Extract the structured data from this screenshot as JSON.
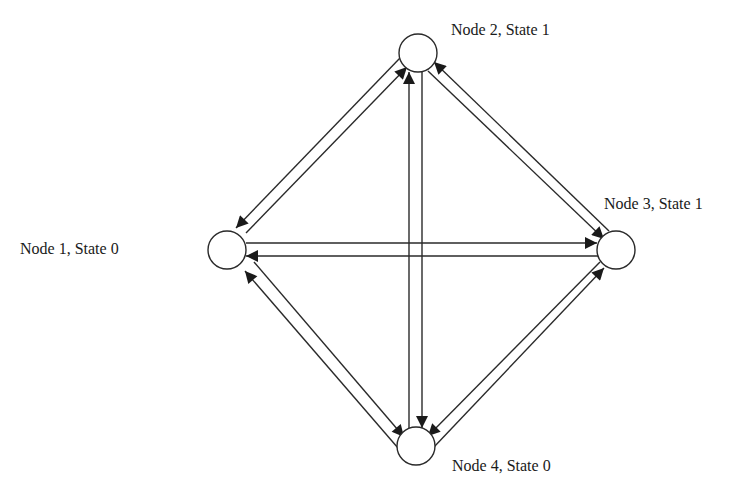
{
  "diagram": {
    "type": "state-transition-graph",
    "nodes": [
      {
        "id": "n1",
        "label": "Node 1, State 0",
        "cx": 227,
        "cy": 250,
        "r": 19,
        "label_x": 20,
        "label_y": 241
      },
      {
        "id": "n2",
        "label": "Node 2, State 1",
        "cx": 418,
        "cy": 53,
        "r": 19,
        "label_x": 451,
        "label_y": 22
      },
      {
        "id": "n3",
        "label": "Node 3, State 1",
        "cx": 616,
        "cy": 250,
        "r": 19,
        "label_x": 604,
        "label_y": 196
      },
      {
        "id": "n4",
        "label": "Node 4, State 0",
        "cx": 416,
        "cy": 446,
        "r": 19,
        "label_x": 452,
        "label_y": 458
      }
    ],
    "edges": [
      {
        "from": "n2",
        "to": "n1"
      },
      {
        "from": "n1",
        "to": "n2"
      },
      {
        "from": "n1",
        "to": "n3"
      },
      {
        "from": "n3",
        "to": "n1"
      },
      {
        "from": "n2",
        "to": "n4"
      },
      {
        "from": "n4",
        "to": "n2"
      },
      {
        "from": "n3",
        "to": "n2"
      },
      {
        "from": "n2",
        "to": "n3"
      },
      {
        "from": "n1",
        "to": "n4"
      },
      {
        "from": "n4",
        "to": "n1"
      },
      {
        "from": "n4",
        "to": "n3"
      },
      {
        "from": "n3",
        "to": "n4"
      }
    ],
    "colors": {
      "stroke": "#2a2a2a",
      "background": "#ffffff",
      "text": "#1a1a1a"
    }
  }
}
